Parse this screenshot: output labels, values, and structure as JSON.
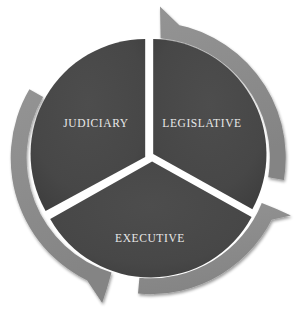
{
  "diagram": {
    "type": "three-segment-cycle",
    "direction": "clockwise",
    "geometry": {
      "center_x": 149,
      "center_y": 158,
      "outer_radius": 137,
      "ring_thickness": 16,
      "inner_radius": 119,
      "gap_width": 8
    },
    "colors": {
      "ring": "#8b8b8b",
      "ring_shadow": "#9a9a9a",
      "segment": "#474747",
      "segment_dark": "#3f3f3f",
      "label_text": "#e8e8e8",
      "background": "#ffffff",
      "gap": "#ffffff"
    },
    "segments": [
      {
        "id": "legislative",
        "label": "LEGISLATIVE",
        "position": "right",
        "label_x": 202,
        "label_y": 123,
        "start_angle": -88,
        "end_angle": 28
      },
      {
        "id": "executive",
        "label": "EXECUTIVE",
        "position": "bottom",
        "label_x": 150,
        "label_y": 238,
        "start_angle": 32,
        "end_angle": 148
      },
      {
        "id": "judiciary",
        "label": "JUDICIARY",
        "position": "left",
        "label_x": 96,
        "label_y": 123,
        "start_angle": 152,
        "end_angle": 268
      }
    ],
    "arrows": [
      {
        "id": "arrow-top",
        "points_to": "legislative",
        "head_angle": -90,
        "description": "clockwise arrowhead at top pointing right"
      },
      {
        "id": "arrow-right",
        "points_to": "executive",
        "head_angle": 30,
        "description": "clockwise arrowhead at lower right pointing down-left"
      },
      {
        "id": "arrow-left",
        "points_to": "judiciary",
        "head_angle": 150,
        "description": "clockwise arrowhead at lower left pointing up-left"
      }
    ]
  }
}
